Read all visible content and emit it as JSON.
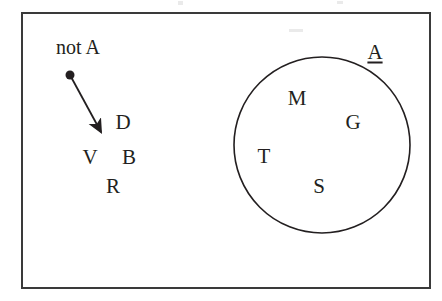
{
  "figure": {
    "type": "venn-set-diagram",
    "background_color": "#ffffff",
    "ink_color": "#231f20"
  },
  "universe": {
    "name": "universe-rectangle",
    "x": 22,
    "y": 13,
    "width": 408,
    "height": 275,
    "stroke_width": 2,
    "stroke_color": "#3a3a3a"
  },
  "set_circle": {
    "name": "set-a-circle",
    "cx": 322,
    "cy": 145,
    "r": 88,
    "stroke_width": 1.6,
    "stroke_color": "#231f20",
    "fill": "none"
  },
  "labels": {
    "set_a": {
      "text": "A",
      "x": 375,
      "y": 52,
      "underlined": true
    },
    "complement": {
      "text": "not A",
      "x": 78,
      "y": 47,
      "underlined": false
    }
  },
  "pointer": {
    "name": "not-a-pointer",
    "dot": {
      "cx": 70,
      "cy": 75,
      "r": 4.5
    },
    "line": {
      "x1": 70,
      "y1": 75,
      "x2": 101,
      "y2": 132
    },
    "arrowhead": {
      "x": 101,
      "y": 134
    },
    "stroke_width": 1.8,
    "color": "#231f20"
  },
  "members_inside": [
    {
      "text": "M",
      "x": 297,
      "y": 98
    },
    {
      "text": "G",
      "x": 353,
      "y": 122
    },
    {
      "text": "T",
      "x": 264,
      "y": 156
    },
    {
      "text": "S",
      "x": 319,
      "y": 186
    }
  ],
  "members_outside": [
    {
      "text": "D",
      "x": 123,
      "y": 122
    },
    {
      "text": "V",
      "x": 90,
      "y": 157
    },
    {
      "text": "B",
      "x": 129,
      "y": 157
    },
    {
      "text": "R",
      "x": 113,
      "y": 186
    }
  ],
  "scan_artifacts": [
    {
      "x": 178,
      "y": 1,
      "width": 5,
      "height": 4
    },
    {
      "x": 337,
      "y": 1,
      "width": 6,
      "height": 3
    },
    {
      "x": 289,
      "y": 29,
      "width": 14,
      "height": 3
    }
  ]
}
